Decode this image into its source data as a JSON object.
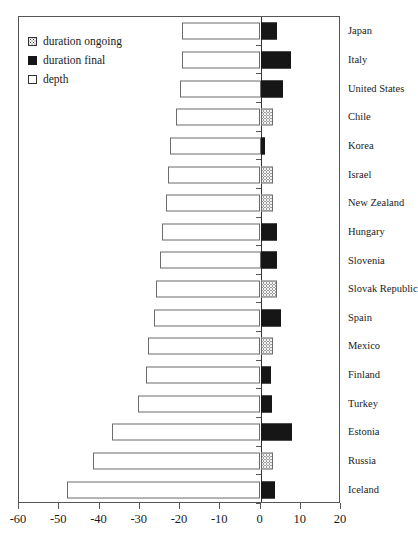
{
  "chart_data": {
    "type": "bar",
    "title": "",
    "xlabel": "",
    "ylabel": "",
    "xlim": [
      -60,
      20
    ],
    "grid": false,
    "orientation": "horizontal",
    "legend_position": "top-left",
    "xticks": [
      -60,
      -50,
      -40,
      -30,
      -20,
      -10,
      0,
      10,
      20
    ],
    "xticklabels": [
      "-60",
      "-50",
      "-40",
      "-30",
      "-20",
      "-10",
      "0",
      "10",
      "20"
    ],
    "categories": [
      "Japan",
      "Italy",
      "United States",
      "Chile",
      "Korea",
      "Israel",
      "New Zealand",
      "Hungary",
      "Slovenia",
      "Slovak Republic",
      "Spain",
      "Mexico",
      "Finland",
      "Turkey",
      "Estonia",
      "Russia",
      "Iceland"
    ],
    "series": [
      {
        "name": "depth",
        "fill": "white",
        "values": [
          -19.5,
          -19.5,
          -20.0,
          -21.0,
          -22.5,
          -23.0,
          -23.5,
          -24.5,
          -25.0,
          -26.0,
          -26.5,
          -28.0,
          -28.5,
          -30.5,
          -37.0,
          -41.5,
          -48.0
        ]
      },
      {
        "name": "duration",
        "values": [
          4.0,
          7.5,
          5.5,
          3.0,
          1.2,
          3.2,
          3.2,
          4.2,
          4.0,
          4.0,
          5.0,
          3.2,
          2.5,
          2.8,
          7.8,
          3.0,
          3.6
        ],
        "kinds": [
          "final",
          "final",
          "final",
          "ongoing",
          "final",
          "ongoing",
          "ongoing",
          "final",
          "final",
          "ongoing",
          "final",
          "ongoing",
          "final",
          "final",
          "final",
          "ongoing",
          "final"
        ]
      }
    ]
  },
  "legend": {
    "items": [
      {
        "label": "duration ongoing",
        "swatch": "dotted-square-icon"
      },
      {
        "label": "duration final",
        "swatch": "filled-square-icon"
      },
      {
        "label": "depth",
        "swatch": "empty-square-icon"
      }
    ]
  }
}
